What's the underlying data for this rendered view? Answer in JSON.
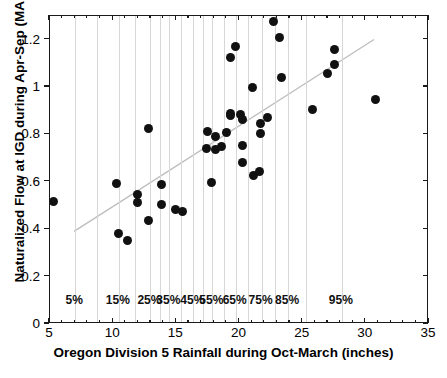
{
  "chart_data": {
    "type": "scatter",
    "title": "",
    "xlabel": "Oregon Division 5 Rainfall during Oct-March (inches)",
    "ylabel": "Naturalized Flow at IGD during Apr-Sep (MAF)",
    "xlim": [
      5,
      35
    ],
    "ylim": [
      0,
      1.3
    ],
    "xticks": [
      5,
      10,
      15,
      20,
      25,
      30,
      35
    ],
    "xticklabels": [
      "5",
      "10",
      "15",
      "20",
      "25",
      "30",
      "35"
    ],
    "yticks": [
      0,
      0.2,
      0.4,
      0.6,
      0.8,
      1,
      1.2
    ],
    "yticklabels": [
      "0",
      "0.2",
      "0.4",
      "0.6",
      "0.8",
      "1",
      "1.2"
    ],
    "grid": "vertical-percentile-lines",
    "legend": "none",
    "marker_color": "#111111",
    "gridline_color": "#d7d7d7",
    "trendline_color": "#bdbdbd",
    "axis_color": "#1a1a1a",
    "percentile_labels": [
      {
        "label": "5%",
        "x": 7.0
      },
      {
        "label": "15%",
        "x": 10.45
      },
      {
        "label": "25%",
        "x": 12.95
      },
      {
        "label": "35%",
        "x": 14.45
      },
      {
        "label": "45%",
        "x": 16.35
      },
      {
        "label": "55%",
        "x": 17.85
      },
      {
        "label": "65%",
        "x": 19.7
      },
      {
        "label": "75%",
        "x": 21.75
      },
      {
        "label": "85%",
        "x": 23.85
      },
      {
        "label": "95%",
        "x": 28.1
      }
    ],
    "percentile_gridlines": [
      7.0,
      8.7,
      10.45,
      11.75,
      12.95,
      13.7,
      14.45,
      15.4,
      16.35,
      17.1,
      17.85,
      18.75,
      19.7,
      20.7,
      21.75,
      22.8,
      23.85,
      25.3,
      28.1
    ],
    "trendline": {
      "x0": 6.9,
      "y0": 0.385,
      "x1": 30.8,
      "y1": 1.2
    },
    "points": [
      {
        "x": 5.3,
        "y": 0.518
      },
      {
        "x": 10.3,
        "y": 0.595
      },
      {
        "x": 10.4,
        "y": 0.383
      },
      {
        "x": 11.1,
        "y": 0.353
      },
      {
        "x": 11.9,
        "y": 0.548
      },
      {
        "x": 11.9,
        "y": 0.512
      },
      {
        "x": 12.8,
        "y": 0.825
      },
      {
        "x": 12.8,
        "y": 0.437
      },
      {
        "x": 13.8,
        "y": 0.59
      },
      {
        "x": 13.8,
        "y": 0.503
      },
      {
        "x": 14.9,
        "y": 0.482
      },
      {
        "x": 15.5,
        "y": 0.473
      },
      {
        "x": 17.5,
        "y": 0.812
      },
      {
        "x": 17.4,
        "y": 0.742
      },
      {
        "x": 17.8,
        "y": 0.598
      },
      {
        "x": 18.1,
        "y": 0.793
      },
      {
        "x": 18.1,
        "y": 0.738
      },
      {
        "x": 18.6,
        "y": 0.75
      },
      {
        "x": 19.0,
        "y": 0.81
      },
      {
        "x": 19.3,
        "y": 0.888
      },
      {
        "x": 19.3,
        "y": 0.878
      },
      {
        "x": 19.3,
        "y": 1.125
      },
      {
        "x": 19.7,
        "y": 1.173
      },
      {
        "x": 20.1,
        "y": 0.885
      },
      {
        "x": 20.2,
        "y": 0.862
      },
      {
        "x": 20.2,
        "y": 0.752
      },
      {
        "x": 20.2,
        "y": 0.682
      },
      {
        "x": 21.0,
        "y": 1.0
      },
      {
        "x": 21.1,
        "y": 0.625
      },
      {
        "x": 21.6,
        "y": 0.645
      },
      {
        "x": 21.7,
        "y": 0.845
      },
      {
        "x": 21.7,
        "y": 0.805
      },
      {
        "x": 22.2,
        "y": 0.872
      },
      {
        "x": 22.7,
        "y": 1.275
      },
      {
        "x": 23.2,
        "y": 1.208
      },
      {
        "x": 23.3,
        "y": 1.04
      },
      {
        "x": 25.8,
        "y": 0.905
      },
      {
        "x": 27.0,
        "y": 1.058
      },
      {
        "x": 27.5,
        "y": 1.095
      },
      {
        "x": 27.5,
        "y": 1.158
      },
      {
        "x": 30.8,
        "y": 0.948
      }
    ]
  }
}
